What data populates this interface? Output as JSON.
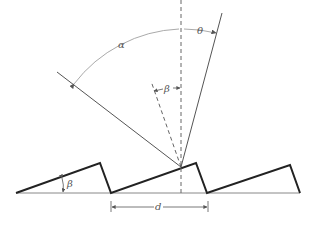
{
  "diagram": {
    "type": "blazed-diffraction-grating",
    "labels": {
      "alpha": "α",
      "theta": "θ",
      "beta_normal": "β",
      "beta_facet": "β",
      "groove_spacing": "d"
    },
    "colors": {
      "grating": "#222222",
      "baseline": "#888888",
      "rays": "#555555",
      "arcs": "#aaaaaa",
      "normal": "#666666"
    }
  }
}
